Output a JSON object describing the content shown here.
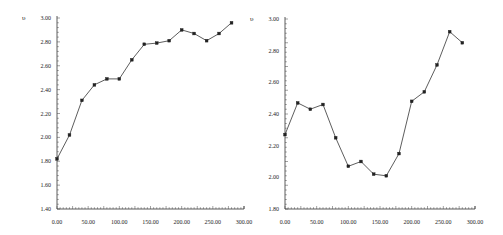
{
  "chart_data": [
    {
      "type": "line",
      "title": "",
      "xlabel": "",
      "ylabel": "υ",
      "xlim": [
        0,
        300
      ],
      "ylim": [
        1.4,
        3.0
      ],
      "x_ticks": [
        "0.00",
        "50.00",
        "100.00",
        "150.00",
        "200.00",
        "250.00",
        "300.00"
      ],
      "y_ticks": [
        "3.00",
        "2.80",
        "2.60",
        "2.40",
        "2.20",
        "2.00",
        "1.80",
        "1.60",
        "1.40"
      ],
      "grid": false,
      "legend": null,
      "x": [
        0,
        20,
        40,
        60,
        80,
        100,
        120,
        140,
        160,
        180,
        200,
        220,
        240,
        260,
        280
      ],
      "values": [
        1.82,
        2.02,
        2.31,
        2.44,
        2.49,
        2.49,
        2.65,
        2.78,
        2.79,
        2.81,
        2.9,
        2.87,
        2.81,
        2.87,
        2.96
      ],
      "frame": {
        "x0": 57,
        "x1": 244,
        "y_top": 18,
        "y_bottom": 209,
        "label_x": 22
      }
    },
    {
      "type": "line",
      "title": "",
      "xlabel": "",
      "ylabel": "υ",
      "xlim": [
        0,
        300
      ],
      "ylim": [
        1.8,
        3.0
      ],
      "x_ticks": [
        "0.00",
        "50.00",
        "100.00",
        "150.00",
        "200.00",
        "250.00",
        "300.00"
      ],
      "y_ticks": [
        "3.00",
        "2.80",
        "2.60",
        "2.40",
        "2.20",
        "2.00",
        "1.80"
      ],
      "grid": false,
      "legend": null,
      "x": [
        0,
        20,
        40,
        60,
        80,
        100,
        120,
        140,
        160,
        180,
        200,
        220,
        240,
        260,
        280
      ],
      "values": [
        2.27,
        2.47,
        2.43,
        2.46,
        2.25,
        2.07,
        2.1,
        2.02,
        2.01,
        2.15,
        2.48,
        2.54,
        2.71,
        2.92,
        2.85
      ],
      "frame": {
        "x0": 285,
        "x1": 475,
        "y_top": 19,
        "y_bottom": 209,
        "label_x": 250
      }
    }
  ]
}
